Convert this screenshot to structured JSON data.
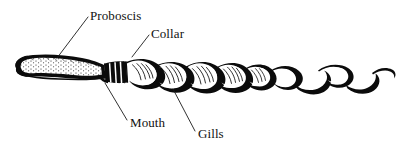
{
  "figure": {
    "style": "black-and-white line engraving",
    "background_color": "#ffffff",
    "ink_color": "#0b0b0b",
    "width": 397,
    "height": 151
  },
  "labels": [
    {
      "id": "proboscis",
      "text": "Proboscis",
      "text_x": 90,
      "text_y": 20,
      "anchor": "start",
      "leader": {
        "x1": 88,
        "y1": 17,
        "x2": 57,
        "y2": 58
      }
    },
    {
      "id": "collar",
      "text": "Collar",
      "text_x": 151,
      "text_y": 38,
      "anchor": "start",
      "leader": {
        "x1": 149,
        "y1": 35,
        "x2": 132,
        "y2": 57
      }
    },
    {
      "id": "mouth",
      "text": "Mouth",
      "text_x": 130,
      "text_y": 127,
      "anchor": "start",
      "leader": {
        "x1": 105,
        "y1": 83,
        "x2": 127,
        "y2": 120
      }
    },
    {
      "id": "gills",
      "text": "Gills",
      "text_x": 198,
      "text_y": 138,
      "anchor": "start",
      "leader": {
        "x1": 173,
        "y1": 89,
        "x2": 195,
        "y2": 131
      }
    }
  ],
  "anatomy": {
    "proboscis": {
      "name": "proboscis",
      "description": "elongated tapering snout at left end, stippled interior",
      "x_range": [
        14,
        105
      ]
    },
    "collar": {
      "name": "collar",
      "description": "dark banded ring segment behind the proboscis",
      "x_range": [
        105,
        127
      ]
    },
    "mouth": {
      "name": "mouth",
      "description": "opening on the underside between proboscis and collar",
      "x_range": [
        100,
        112
      ]
    },
    "gills": {
      "name": "gills",
      "description": "striped branchial region of coiled trunk",
      "x_range": [
        127,
        252
      ]
    },
    "trunk": {
      "name": "trunk",
      "description": "long twisting tail extending to right edge",
      "x_range": [
        252,
        392
      ]
    }
  }
}
